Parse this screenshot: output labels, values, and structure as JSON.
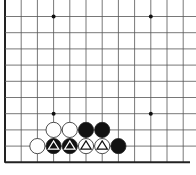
{
  "diagram": {
    "type": "go-board-partial",
    "grid": {
      "columns": 12,
      "rows": 11,
      "origin_x": 5,
      "origin_y": 0,
      "spacing": 16.2,
      "left_edge": true,
      "bottom_edge": true,
      "top_edge": false,
      "right_edge": false
    },
    "colors": {
      "line": "#555555",
      "edge": "#222222",
      "black_stone": "#111111",
      "white_stone": "#ffffff",
      "stone_outline": "#222222",
      "star_point": "#111111"
    },
    "star_points": [
      {
        "col": 3,
        "row": 1
      },
      {
        "col": 9,
        "row": 1
      },
      {
        "col": 3,
        "row": 7
      },
      {
        "col": 9,
        "row": 7
      }
    ],
    "stones": [
      {
        "col": 3,
        "row": 8,
        "color": "white",
        "marker": null
      },
      {
        "col": 4,
        "row": 8,
        "color": "white",
        "marker": null
      },
      {
        "col": 5,
        "row": 8,
        "color": "black",
        "marker": null
      },
      {
        "col": 6,
        "row": 8,
        "color": "black",
        "marker": null
      },
      {
        "col": 2,
        "row": 9,
        "color": "white",
        "marker": null
      },
      {
        "col": 3,
        "row": 9,
        "color": "black",
        "marker": "triangle"
      },
      {
        "col": 4,
        "row": 9,
        "color": "black",
        "marker": "triangle"
      },
      {
        "col": 5,
        "row": 9,
        "color": "white",
        "marker": "triangle"
      },
      {
        "col": 6,
        "row": 9,
        "color": "white",
        "marker": "triangle"
      },
      {
        "col": 7,
        "row": 9,
        "color": "black",
        "marker": null
      }
    ],
    "caption": ""
  }
}
